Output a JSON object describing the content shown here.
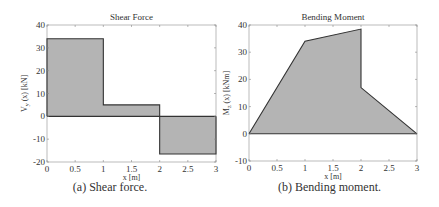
{
  "chart_data": [
    {
      "type": "area",
      "panel": "a",
      "title": "Shear Force",
      "xlabel": "x [m]",
      "ylabel": "V_y (x) [kN]",
      "ylabel_main": "V",
      "ylabel_sub": "y",
      "ylabel_rest": "(x) [kN]",
      "xlim": [
        0,
        3
      ],
      "ylim": [
        -20,
        40
      ],
      "xticks": [
        0,
        0.5,
        1,
        1.5,
        2,
        2.5,
        3
      ],
      "xtick_labels": [
        "0",
        "0.5",
        "1",
        "1.5",
        "2",
        "2.5",
        "3"
      ],
      "yticks": [
        -20,
        -10,
        0,
        10,
        20,
        30,
        40
      ],
      "ytick_labels": [
        "-20",
        "-10",
        "0",
        "10",
        "20",
        "30",
        "40"
      ],
      "grid": false,
      "fill_color": "#b4b4b4",
      "x": [
        0,
        0,
        1,
        1,
        2,
        2,
        3,
        3
      ],
      "y": [
        0,
        34,
        34,
        5,
        5,
        -16.5,
        -16.5,
        0
      ],
      "segments": [
        {
          "x_start": 0,
          "x_end": 1,
          "value": 34
        },
        {
          "x_start": 1,
          "x_end": 2,
          "value": 5
        },
        {
          "x_start": 2,
          "x_end": 3,
          "value": -16.5
        }
      ],
      "caption": "(a)  Shear force."
    },
    {
      "type": "area",
      "panel": "b",
      "title": "Bending Moment",
      "xlabel": "x [m]",
      "ylabel": "M_z (x) [kNm]",
      "ylabel_main": "M",
      "ylabel_sub": "z",
      "ylabel_rest": "(x) [kNm]",
      "xlim": [
        0,
        3
      ],
      "ylim": [
        -10,
        40
      ],
      "xticks": [
        0,
        0.5,
        1,
        1.5,
        2,
        2.5,
        3
      ],
      "xtick_labels": [
        "0",
        "0.5",
        "1",
        "1.5",
        "2",
        "2.5",
        "3"
      ],
      "yticks": [
        -10,
        0,
        10,
        20,
        30,
        40
      ],
      "ytick_labels": [
        "-10",
        "0",
        "10",
        "20",
        "30",
        "40"
      ],
      "grid": false,
      "fill_color": "#b4b4b4",
      "x": [
        0,
        1,
        2,
        2,
        3
      ],
      "y": [
        0,
        34,
        38.5,
        17,
        0
      ],
      "caption": "(b)  Bending moment."
    }
  ]
}
